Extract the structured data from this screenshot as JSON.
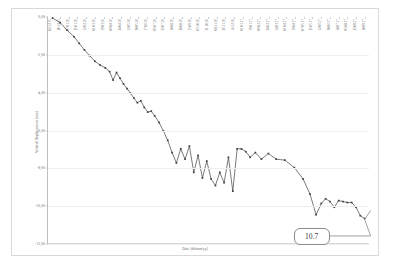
{
  "chart_data": {
    "type": "line",
    "title": "",
    "xlabel": "Date [dd/mm/yy]",
    "ylabel": "Vertical Displacement [mm]",
    "ylim": [
      -12.0,
      0.0
    ],
    "yticks": [
      "0,00",
      "-2,00",
      "-4,00",
      "-6,00",
      "-8,00",
      "-10,00",
      "-12,00"
    ],
    "ytick_values": [
      0.0,
      -2.0,
      -4.0,
      -6.0,
      -8.0,
      -10.0,
      -12.0
    ],
    "grid": true,
    "legend": "none",
    "marker": "diamond",
    "line_color": "#404040",
    "grid_color": "#eceef0",
    "categories": [
      "02.12.15",
      "20.12.15",
      "07.01.16",
      "25.01.16",
      "12.02.16",
      "01.03.16",
      "19.03.16",
      "06.04.16",
      "24.04.16",
      "12.05.16",
      "30.05.16",
      "17.06.16",
      "05.07.16",
      "23.07.16",
      "10.08.16",
      "28.08.16",
      "15.09.16",
      "03.10.16",
      "21.10.16",
      "08.11.16",
      "26.11.16",
      "14.12.16",
      "01.01.17",
      "19.01.17",
      "06.02.17",
      "24.02.17",
      "14.03.17",
      "01.04.17",
      "19.04.17",
      "07.05.17",
      "25.05.17",
      "12.06.17",
      "30.06.17",
      "18.07.17",
      "05.08.17",
      "23.08.17",
      "10.09.17"
    ],
    "series": [
      {
        "name": "Vertical Displacement",
        "x": [
          0.5,
          1.4,
          2.2,
          3.0,
          3.6,
          4.2,
          4.8,
          5.4,
          6.0,
          6.6,
          7.1,
          7.5,
          7.9,
          8.3,
          8.7,
          9.1,
          9.5,
          9.9,
          10.3,
          10.7,
          11.1,
          11.5,
          11.9,
          12.3,
          12.8,
          13.3,
          13.8,
          14.3,
          14.8,
          15.3,
          15.8,
          16.3,
          16.8,
          17.3,
          17.8,
          18.3,
          18.8,
          19.3,
          19.8,
          20.3,
          20.8,
          21.3,
          21.8,
          22.3,
          22.8,
          23.3,
          23.9,
          24.6,
          25.4,
          26.3,
          27.3,
          28.4,
          29.4,
          30.2,
          30.9,
          31.5,
          32.0,
          32.5,
          33.0,
          33.5,
          34.0,
          34.5,
          35.0,
          35.5,
          36.0,
          36.5
        ],
        "values": [
          -0.05,
          -0.3,
          -0.7,
          -1.05,
          -1.4,
          -1.75,
          -2.05,
          -2.35,
          -2.55,
          -2.7,
          -2.9,
          -3.35,
          -2.95,
          -3.25,
          -3.55,
          -3.8,
          -4.05,
          -4.3,
          -4.55,
          -4.45,
          -4.8,
          -5.05,
          -5.0,
          -5.25,
          -5.6,
          -6.05,
          -6.55,
          -7.2,
          -7.75,
          -7.0,
          -7.55,
          -6.85,
          -8.25,
          -7.35,
          -8.55,
          -7.65,
          -8.6,
          -8.95,
          -8.25,
          -8.8,
          -7.45,
          -9.25,
          -7.0,
          -7.0,
          -7.15,
          -7.45,
          -7.2,
          -7.55,
          -7.25,
          -7.55,
          -7.6,
          -8.0,
          -8.6,
          -9.4,
          -10.5,
          -9.9,
          -9.65,
          -9.8,
          -10.1,
          -9.75,
          -9.8,
          -9.85,
          -9.85,
          -10.1,
          -10.55,
          -10.7
        ]
      }
    ],
    "annotations": [
      {
        "text": "10.7",
        "points_to_last": true
      }
    ]
  }
}
